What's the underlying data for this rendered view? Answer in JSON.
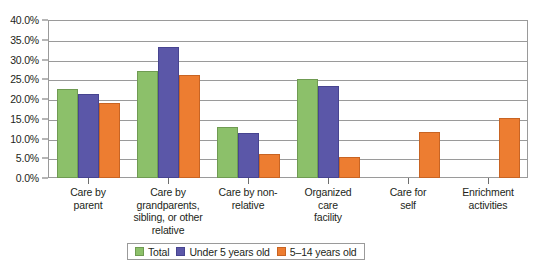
{
  "chart_data": {
    "type": "bar",
    "title": "",
    "xlabel": "",
    "ylabel": "",
    "ylim": [
      0,
      40
    ],
    "grid": true,
    "legend_position": "bottom",
    "categories": [
      "Care by parent",
      "Care by grandparents, sibling, or other relative",
      "Care by non-relative",
      "Organized care facility",
      "Care for self",
      "Enrichment activities"
    ],
    "category_lines": [
      [
        "Care by",
        "parent"
      ],
      [
        "Care by",
        "grandparents,",
        "sibling, or other",
        "relative"
      ],
      [
        "Care by non-",
        "relative"
      ],
      [
        "Organized",
        "care",
        "facility"
      ],
      [
        "Care for",
        "self"
      ],
      [
        "Enrichment",
        "activities"
      ]
    ],
    "ytick_labels": [
      "0.0%",
      "5.0%",
      "10.0%",
      "15.0%",
      "20.0%",
      "25.0%",
      "30.0%",
      "35.0%",
      "40.0%"
    ],
    "ytick_values": [
      0,
      5,
      10,
      15,
      20,
      25,
      30,
      35,
      40
    ],
    "series": [
      {
        "name": "Total",
        "color": "#8cc06a",
        "values": [
          22.5,
          27.2,
          13.0,
          25.0,
          null,
          null
        ]
      },
      {
        "name": "Under  5 years old",
        "color": "#5b57a8",
        "values": [
          21.3,
          33.2,
          11.3,
          23.2,
          null,
          null
        ]
      },
      {
        "name": "5–14 years old",
        "color": "#ed7d31",
        "values": [
          19.0,
          26.0,
          6.0,
          5.3,
          11.7,
          15.2
        ]
      }
    ]
  }
}
